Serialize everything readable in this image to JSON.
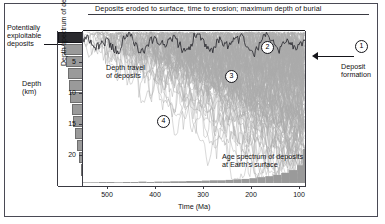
{
  "header": {
    "title": "Deposits eroded to surface, time to erosion; maximum depth of burial",
    "items": [
      {
        "marker": "4",
        "label": "800 Ma; 20 km"
      },
      {
        "marker": "3",
        "label": "400 Ma; 12 km"
      },
      {
        "marker": "2",
        "label": "200 Ma; 6 km"
      },
      {
        "marker": "1",
        "label": "50 Ma; 2 km"
      }
    ]
  },
  "left": {
    "exploitable_label": "Potentially\nexploitable\ndeposits",
    "depth_axis_title": "Depth\n(km)",
    "spectrum_label": "Depth spectrum of deposits"
  },
  "right": {
    "deposit_formation_label": "Deposit\nformation",
    "callout_marker": "1"
  },
  "annotations": {
    "depth_travel": "Depth travel\nof deposits",
    "age_spectrum": "Age spectrum of deposits\nat Earth's surface"
  },
  "axes": {
    "x_title": "Time (Ma)",
    "x_ticks": [
      "500",
      "400",
      "300",
      "200",
      "100"
    ],
    "y_ticks": [
      "5",
      "10",
      "15",
      "20"
    ]
  },
  "callouts": [
    {
      "marker": "4",
      "x": 157,
      "y": 115
    },
    {
      "marker": "3",
      "x": 225,
      "y": 70
    },
    {
      "marker": "2",
      "x": 261,
      "y": 41
    },
    {
      "marker": "1",
      "x": 355,
      "y": 40
    }
  ],
  "colors": {
    "trajectory_line": "#9d9d9d",
    "histogram_fill": "#9a9a9a",
    "exploitable_bar": "#2a2a2e",
    "axis": "#3a3a42",
    "text": "#111111",
    "background": "#ffffff"
  },
  "chart_data": {
    "type": "line",
    "title": "Deposits eroded to surface, time to erosion; maximum depth of burial",
    "xlabel": "Time (Ma)",
    "ylabel": "Depth (km)",
    "xlim": [
      560,
      0
    ],
    "ylim": [
      0,
      24
    ],
    "x_ticks": [
      500,
      400,
      300,
      200,
      100
    ],
    "y_ticks": [
      5,
      10,
      15,
      20
    ],
    "grid": false,
    "legend": "none",
    "series": [
      {
        "name": "shallow-envelope",
        "comment": "Upper envelope of deposit trajectories, depth in km vs time in Ma",
        "x": [
          560,
          520,
          480,
          440,
          400,
          360,
          320,
          280,
          240,
          200,
          170,
          140,
          110,
          80,
          50,
          20,
          0
        ],
        "values": [
          1.2,
          1.0,
          1.4,
          1.1,
          1.6,
          1.3,
          1.8,
          1.5,
          2.2,
          1.9,
          2.6,
          2.1,
          3.0,
          2.4,
          1.8,
          1.2,
          0.6
        ]
      },
      {
        "name": "mid-trajectory",
        "comment": "Representative mid-ensemble trajectory",
        "x": [
          560,
          500,
          440,
          380,
          320,
          260,
          200,
          150,
          100,
          60,
          20,
          0
        ],
        "values": [
          10.5,
          11.5,
          9.8,
          12.4,
          10.9,
          8.5,
          6.4,
          5.0,
          3.6,
          2.4,
          1.4,
          0.8
        ]
      },
      {
        "name": "deep-trajectory",
        "comment": "Representative deep-ensemble trajectory",
        "x": [
          560,
          500,
          440,
          380,
          320,
          260,
          200,
          150,
          100,
          60,
          20,
          0
        ],
        "values": [
          19.5,
          20.5,
          18.8,
          21.0,
          19.4,
          17.2,
          14.0,
          11.0,
          8.0,
          5.0,
          2.5,
          1.0
        ]
      }
    ],
    "depth_spectrum": {
      "type": "bar",
      "orientation": "horizontal",
      "title": "Depth spectrum of deposits",
      "ylabel": "Depth (km)",
      "bins": [
        0.8,
        2.6,
        4.6,
        6.6,
        8.6,
        10.6,
        12.6,
        14.6,
        16.6,
        18.6,
        20.6,
        22.4
      ],
      "values": [
        100,
        78,
        70,
        62,
        58,
        52,
        46,
        40,
        34,
        26,
        18,
        9
      ],
      "exploitable_bin_index": 0
    },
    "age_spectrum": {
      "type": "bar",
      "title": "Age spectrum of deposits at Earth's surface",
      "xlabel": "Time (Ma)",
      "categories": [
        560,
        540,
        520,
        500,
        480,
        460,
        440,
        420,
        400,
        380,
        360,
        340,
        320,
        300,
        280,
        260,
        240,
        220,
        200,
        180,
        160,
        140,
        120,
        100,
        80,
        60,
        40,
        20,
        5
      ],
      "values": [
        2,
        2,
        3,
        3,
        2,
        3,
        3,
        4,
        3,
        4,
        4,
        5,
        5,
        6,
        6,
        7,
        8,
        8,
        9,
        11,
        12,
        14,
        17,
        20,
        24,
        30,
        38,
        52,
        100
      ]
    }
  }
}
